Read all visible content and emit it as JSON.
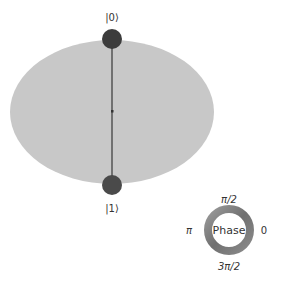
{
  "sphere": {
    "top_label": "|0⟩",
    "bottom_label": "|1⟩",
    "ellipse_color": "#c8c8c8",
    "axis_color": "#555555",
    "state_color": "#3c3c3c"
  },
  "phase_wheel": {
    "center_label": "Phase",
    "top_label": "π/2",
    "left_label": "π",
    "right_label": "0",
    "bottom_label": "3π/2"
  }
}
